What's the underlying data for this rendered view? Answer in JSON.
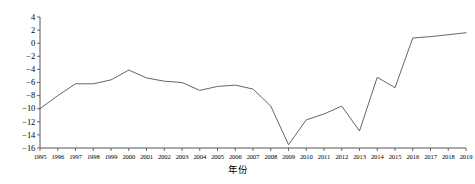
{
  "chart_data": {
    "type": "line",
    "title": "",
    "subtitle": "",
    "xlabel": "年份",
    "ylabel": "",
    "grid": false,
    "legend": "none",
    "line_color": "#555555",
    "categories": [
      "1995",
      "1996",
      "1997",
      "1998",
      "1999",
      "2000",
      "2001",
      "2002",
      "2003",
      "2004",
      "2005",
      "2006",
      "2007",
      "2008",
      "2009",
      "2010",
      "2011",
      "2012",
      "2013",
      "2014",
      "2015",
      "2016",
      "2017",
      "2018",
      "2019"
    ],
    "x": [
      1995,
      1996,
      1997,
      1998,
      1999,
      2000,
      2001,
      2002,
      2003,
      2004,
      2005,
      2006,
      2007,
      2008,
      2009,
      2010,
      2011,
      2012,
      2013,
      2014,
      2015,
      2016,
      2017,
      2018,
      2019
    ],
    "values": [
      -10.0,
      -8.0,
      -6.2,
      -6.2,
      -5.6,
      -4.1,
      -5.3,
      -5.8,
      -6.0,
      -7.2,
      -6.6,
      -6.4,
      -7.0,
      -9.6,
      -15.5,
      -11.7,
      -10.8,
      -9.6,
      -13.4,
      -5.2,
      -6.8,
      0.8,
      1.0,
      1.3,
      1.6
    ],
    "xlim": [
      1995,
      2019
    ],
    "ylim": [
      -16,
      4
    ],
    "yticks": [
      4,
      2,
      0,
      -2,
      -4,
      -6,
      -8,
      -10,
      -12,
      -14,
      -16
    ],
    "ytick_labels": [
      "4",
      "2",
      "0",
      "−2",
      "−4",
      "−6",
      "−8",
      "−10",
      "−12",
      "−14",
      "−16"
    ],
    "xticks": [
      1995,
      1996,
      1997,
      1998,
      1999,
      2000,
      2001,
      2002,
      2003,
      2004,
      2005,
      2006,
      2007,
      2008,
      2009,
      2010,
      2011,
      2012,
      2013,
      2014,
      2015,
      2016,
      2017,
      2018,
      2019
    ],
    "xtick_labels": [
      "1995",
      "1996",
      "1997",
      "1998",
      "1999",
      "2000",
      "2001",
      "2002",
      "2003",
      "2004",
      "2005",
      "2006",
      "2007",
      "2008",
      "2009",
      "2010",
      "2011",
      "2012",
      "2013",
      "2014",
      "2015",
      "2016",
      "2017",
      "2018",
      "2019"
    ]
  },
  "axes": {
    "spine_color": "#444444",
    "x_axis_title": "年份"
  }
}
